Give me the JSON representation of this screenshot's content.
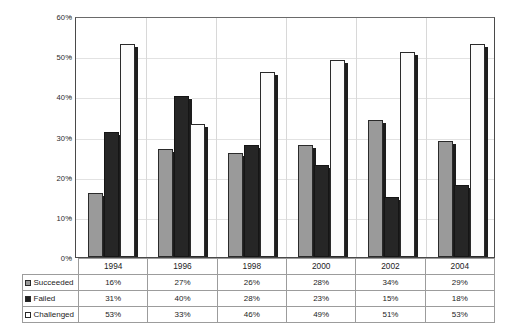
{
  "chart_data": {
    "type": "bar",
    "title": "",
    "xlabel": "",
    "ylabel": "",
    "ylim": [
      0,
      60
    ],
    "ytick_labels": [
      "0%",
      "10%",
      "20%",
      "30%",
      "40%",
      "50%",
      "60%"
    ],
    "ytick_values": [
      0,
      10,
      20,
      30,
      40,
      50,
      60
    ],
    "grid": true,
    "legend_position": "table-left",
    "categories": [
      "1994",
      "1996",
      "1998",
      "2000",
      "2002",
      "2004"
    ],
    "series": [
      {
        "name": "Succeeded",
        "swatch": "succeeded-swatch",
        "color": "#9a9a9a",
        "values": [
          16,
          27,
          26,
          28,
          34,
          29
        ],
        "labels": [
          "16%",
          "27%",
          "26%",
          "28%",
          "34%",
          "29%"
        ]
      },
      {
        "name": "Failed",
        "swatch": "failed-swatch",
        "color": "#262626",
        "values": [
          31,
          40,
          28,
          23,
          15,
          18
        ],
        "labels": [
          "31%",
          "40%",
          "28%",
          "23%",
          "15%",
          "18%"
        ]
      },
      {
        "name": "Challenged",
        "swatch": "challenged-swatch",
        "color": "#ffffff",
        "values": [
          53,
          33,
          46,
          49,
          51,
          53
        ],
        "labels": [
          "53%",
          "33%",
          "46%",
          "49%",
          "51%",
          "53%"
        ]
      }
    ]
  },
  "table": {
    "corner": "",
    "header": [
      "1994",
      "1996",
      "1998",
      "2000",
      "2002",
      "2004"
    ],
    "rows": [
      {
        "label": "Succeeded",
        "values": [
          "16%",
          "27%",
          "26%",
          "28%",
          "34%",
          "29%"
        ]
      },
      {
        "label": "Failed",
        "values": [
          "31%",
          "40%",
          "28%",
          "23%",
          "15%",
          "18%"
        ]
      },
      {
        "label": "Challenged",
        "values": [
          "53%",
          "33%",
          "46%",
          "49%",
          "51%",
          "53%"
        ]
      }
    ]
  }
}
